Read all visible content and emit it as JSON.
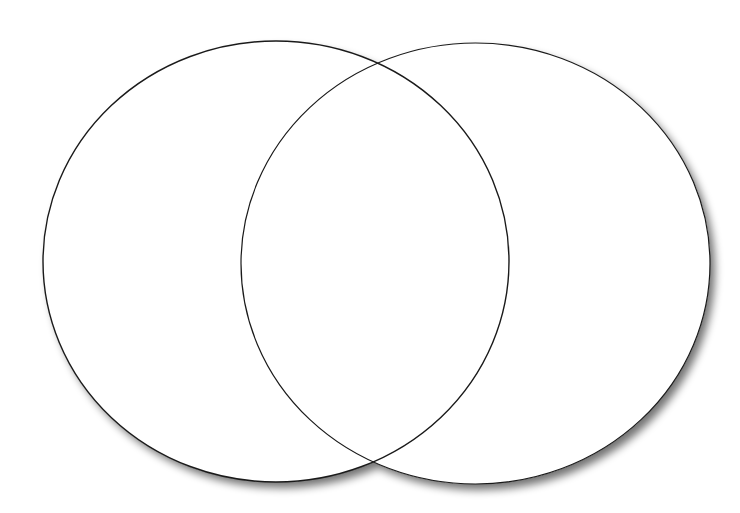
{
  "diagram": {
    "type": "venn",
    "title": "",
    "background": "#ffffff",
    "stroke_color": "#1a1a1a",
    "shadow_color": "#6e6e6e",
    "sets": [
      {
        "label": "",
        "cx": 276,
        "cy": 261.5,
        "rx": 233,
        "ry": 220.5
      },
      {
        "label": "",
        "cx": 475.5,
        "cy": 263.5,
        "rx": 234.5,
        "ry": 220.5
      }
    ],
    "intersection_label": ""
  }
}
